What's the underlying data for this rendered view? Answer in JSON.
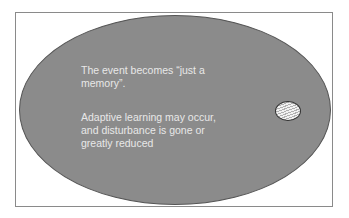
{
  "diagram": {
    "type": "ellipse-with-inner-marker",
    "colors": {
      "ellipse_fill": "#8b8b8b",
      "text": "#e8e8e8",
      "frame_border": "#8a8a8a",
      "marker_outline": "#333333"
    },
    "text_blocks": [
      "The event becomes “just a memory”.",
      "Adaptive learning may occur, and disturbance is gone or greatly reduced"
    ],
    "marker": {
      "name": "small-hatched-oval",
      "pattern": "wavy-lines"
    }
  }
}
